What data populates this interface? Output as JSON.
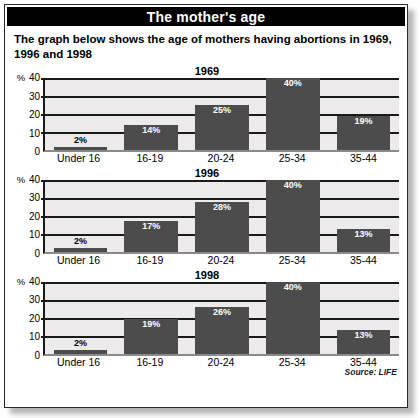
{
  "header": {
    "title": "The mother's age"
  },
  "intro": {
    "text": "The graph below shows the age of mothers having abortions in 1969, 1996 and 1998"
  },
  "source": {
    "text": "Source: LIFE"
  },
  "axis": {
    "unit": "%",
    "ticks": [
      "40",
      "30",
      "20",
      "10",
      "0"
    ]
  },
  "chart_data": [
    {
      "type": "bar",
      "title": "1969",
      "categories": [
        "Under 16",
        "16-19",
        "20-24",
        "25-34",
        "35-44"
      ],
      "values": [
        2,
        14,
        25,
        40,
        19
      ],
      "value_labels": [
        "2%",
        "14%",
        "25%",
        "40%",
        "19%"
      ],
      "xlabel": "",
      "ylabel": "%",
      "ylim": [
        0,
        40
      ],
      "yticks": [
        0,
        10,
        20,
        30,
        40
      ],
      "grid": true,
      "legend": false
    },
    {
      "type": "bar",
      "title": "1996",
      "categories": [
        "Under 16",
        "16-19",
        "20-24",
        "25-34",
        "35-44"
      ],
      "values": [
        2,
        17,
        28,
        40,
        13
      ],
      "value_labels": [
        "2%",
        "17%",
        "28%",
        "40%",
        "13%"
      ],
      "xlabel": "",
      "ylabel": "%",
      "ylim": [
        0,
        40
      ],
      "yticks": [
        0,
        10,
        20,
        30,
        40
      ],
      "grid": true,
      "legend": false
    },
    {
      "type": "bar",
      "title": "1998",
      "categories": [
        "Under 16",
        "16-19",
        "20-24",
        "25-34",
        "35-44"
      ],
      "values": [
        2,
        19,
        26,
        40,
        13
      ],
      "value_labels": [
        "2%",
        "19%",
        "26%",
        "40%",
        "13%"
      ],
      "xlabel": "",
      "ylabel": "%",
      "ylim": [
        0,
        40
      ],
      "yticks": [
        0,
        10,
        20,
        30,
        40
      ],
      "grid": true,
      "legend": false
    }
  ],
  "colors": {
    "bar": "#4c4c4c",
    "header_bg": "#000000",
    "header_text": "#ffffff",
    "plot_bg": "#eceaea",
    "gridline": "#1a1a1a"
  }
}
